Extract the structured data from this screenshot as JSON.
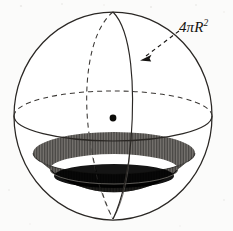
{
  "figure": {
    "background_color": "#fbfbfa",
    "ink_color": "#14120f",
    "stroke_color": "#2a2724"
  },
  "labels": {
    "surface_area": {
      "text": "4πR",
      "coefficient": "4",
      "pi": "π",
      "radius_symbol": "R",
      "exponent": "2",
      "full_text": "4πR²",
      "meaning": "surface area of a sphere",
      "x": 179,
      "y": 19
    }
  },
  "sphere": {
    "center": {
      "x": 113,
      "y": 116
    },
    "radius_x": 99,
    "radius_y": 104,
    "top_y": 12,
    "bottom_y": 219,
    "left_x": 14,
    "right_x": 212,
    "outline_color": "#2a2724",
    "outline_width": 1.2,
    "fill": "#ffffff"
  },
  "equator": {
    "name": "equator-ellipse",
    "center": {
      "x": 113,
      "y": 116
    },
    "radius_x": 99,
    "radius_y": 25,
    "back_half_style": "dashed",
    "front_half_style": "solid",
    "dash_pattern": "5,4",
    "color": "#2a2724"
  },
  "meridians": [
    {
      "name": "back-meridian",
      "style": "dashed",
      "dash_pattern": "5,4",
      "radius_x": 18,
      "offset_x": -16,
      "color": "#2a2724"
    },
    {
      "name": "front-meridian",
      "style": "solid",
      "radius_x": 18,
      "offset_x": 17,
      "color": "#2a2724"
    }
  ],
  "center_point": {
    "name": "sphere-center-dot",
    "x": 113,
    "y": 118,
    "radius": 3.4,
    "color": "#0c0b09"
  },
  "spherical_cap": {
    "name": "shaded-spherical-cap",
    "rim_center": {
      "x": 114,
      "y": 153
    },
    "rim_radius_x": 81,
    "rim_radius_y": 21,
    "bottom_y": 218,
    "rim_fill_color": "#4a4845",
    "interior_fill_color": "#0a0a09",
    "inner_rim_center": {
      "x": 114,
      "y": 169
    },
    "inner_rim_radius_x": 64,
    "inner_rim_radius_y": 15,
    "hatch_color": "#6e6c68",
    "description": "dark shaded bowl-shaped cap at the bottom of the sphere"
  },
  "leader_arrow": {
    "name": "label-leader-arrow",
    "style": "dashed",
    "dash_pattern": "4,3.5",
    "start": {
      "x": 178,
      "y": 31
    },
    "end": {
      "x": 141,
      "y": 59
    },
    "arrowhead_at": "end",
    "color": "#1a1816",
    "points_to": "sphere surface"
  }
}
